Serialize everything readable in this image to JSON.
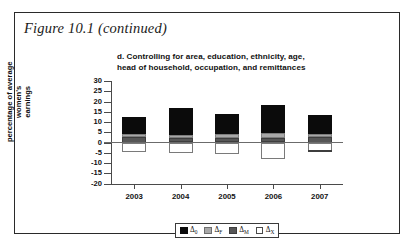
{
  "figure": {
    "caption": "Figure 10.1 (continued)",
    "panel_title_line1": "d. Controlling for area, education, ethnicity, age,",
    "panel_title_line2": "head of household, occupation, and remittances"
  },
  "legend": {
    "items": [
      {
        "key": "d0",
        "label": "Δ0",
        "symbol": "Δ",
        "sub": "0",
        "color": "#0b0b0b"
      },
      {
        "key": "dF",
        "label": "ΔF",
        "symbol": "Δ",
        "sub": "F",
        "color": "#a8a8a8"
      },
      {
        "key": "dM",
        "label": "ΔM",
        "symbol": "Δ",
        "sub": "M",
        "color": "#565656"
      },
      {
        "key": "dX",
        "label": "ΔX",
        "symbol": "Δ",
        "sub": "X",
        "color": "#ffffff"
      }
    ]
  },
  "chart_data": {
    "type": "bar",
    "subtype": "stacked-bar-diverging",
    "title": "d. Controlling for area, education, ethnicity, age, head of household, occupation, and remittances",
    "xlabel": "",
    "ylabel": "percentage of average women's earnings",
    "ylabel_line1": "percentage of average women's",
    "ylabel_line2": "earnings",
    "categories": [
      "2003",
      "2004",
      "2005",
      "2006",
      "2007"
    ],
    "ylim": [
      -20,
      30
    ],
    "yticks": [
      30,
      25,
      20,
      15,
      10,
      5,
      0,
      -5,
      -10,
      -15,
      -20
    ],
    "ytick_labels": [
      "30",
      "25",
      "20",
      "15",
      "10",
      "5",
      "0",
      "-5",
      "-10",
      "-15",
      "-20"
    ],
    "grid": false,
    "legend_position": "bottom",
    "series": [
      {
        "name": "Δ0",
        "key": "d0",
        "color": "#0b0b0b",
        "values": [
          8.2,
          13.5,
          10.0,
          13.6,
          9.6
        ]
      },
      {
        "name": "ΔF",
        "key": "dF",
        "color": "#a8a8a8",
        "values": [
          1.5,
          1.5,
          2.0,
          2.5,
          1.5
        ]
      },
      {
        "name": "ΔM",
        "key": "dM",
        "color": "#565656",
        "values": [
          2.5,
          2.0,
          2.0,
          2.0,
          2.5
        ]
      },
      {
        "name": "ΔX",
        "key": "dX",
        "color": "#ffffff",
        "values": [
          -4.5,
          -5.3,
          -5.4,
          -8.2,
          -4.4
        ]
      }
    ],
    "totals_positive": [
      12.2,
      17.0,
      14.0,
      18.1,
      13.6
    ],
    "totals_negative": [
      -4.5,
      -5.3,
      -5.4,
      -8.2,
      -4.4
    ],
    "annotations": []
  }
}
